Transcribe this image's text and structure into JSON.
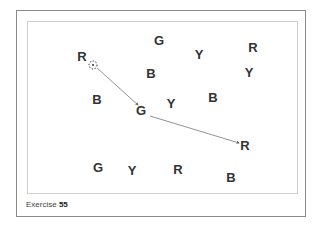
{
  "caption": {
    "label": "Exercise",
    "number": "55"
  },
  "letters": [
    {
      "t": "G",
      "x": 159,
      "y": 40
    },
    {
      "t": "Y",
      "x": 199,
      "y": 54
    },
    {
      "t": "R",
      "x": 253,
      "y": 47
    },
    {
      "t": "R",
      "x": 82,
      "y": 56
    },
    {
      "t": "B",
      "x": 151,
      "y": 73
    },
    {
      "t": "Y",
      "x": 249,
      "y": 72
    },
    {
      "t": "B",
      "x": 97,
      "y": 99
    },
    {
      "t": "Y",
      "x": 171,
      "y": 103
    },
    {
      "t": "B",
      "x": 213,
      "y": 97
    },
    {
      "t": "G",
      "x": 141,
      "y": 110
    },
    {
      "t": "R",
      "x": 245,
      "y": 145
    },
    {
      "t": "G",
      "x": 98,
      "y": 167
    },
    {
      "t": "Y",
      "x": 132,
      "y": 170
    },
    {
      "t": "R",
      "x": 178,
      "y": 169
    },
    {
      "t": "B",
      "x": 231,
      "y": 177
    }
  ],
  "start_marker": {
    "x": 93,
    "y": 65
  },
  "path": [
    [
      97,
      68
    ],
    [
      138,
      105
    ],
    [
      150,
      116
    ],
    [
      239,
      143
    ]
  ]
}
